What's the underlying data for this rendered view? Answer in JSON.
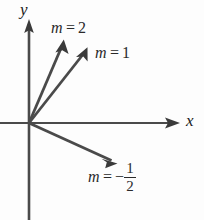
{
  "figure": {
    "type": "coordinate-diagram",
    "background_color": "#fdfdfd",
    "stroke_color": "#3a3a3a",
    "text_color": "#2a2a2a",
    "width": 204,
    "height": 220
  },
  "axes": {
    "origin": {
      "x": 29,
      "y": 123
    },
    "x_axis": {
      "label": "x",
      "start": {
        "x": 0,
        "y": 123
      },
      "end": {
        "x": 179,
        "y": 123
      },
      "arrow": "right",
      "label_pos": {
        "x": 186,
        "y": 112
      }
    },
    "y_axis": {
      "label": "y",
      "start": {
        "x": 29,
        "y": 220
      },
      "end": {
        "x": 29,
        "y": 22
      },
      "arrow": "up",
      "label_pos": {
        "x": 20,
        "y": 1
      }
    }
  },
  "rays": [
    {
      "name": "slope-2-ray",
      "slope": 2,
      "label_text": {
        "var": "m",
        "eq": "=",
        "value": "2"
      },
      "from": {
        "x": 29,
        "y": 123
      },
      "to": {
        "x": 63,
        "y": 41
      },
      "label_pos": {
        "x": 51,
        "y": 20
      }
    },
    {
      "name": "slope-1-ray",
      "slope": 1,
      "label_text": {
        "var": "m",
        "eq": "=",
        "value": "1"
      },
      "from": {
        "x": 29,
        "y": 123
      },
      "to": {
        "x": 87,
        "y": 49
      },
      "label_pos": {
        "x": 95,
        "y": 45
      }
    },
    {
      "name": "slope-negative-half-ray",
      "slope": -0.5,
      "label_text": {
        "var": "m",
        "eq": "=",
        "minus": "−",
        "numerator": "1",
        "denominator": "2"
      },
      "from": {
        "x": 29,
        "y": 123
      },
      "to": {
        "x": 116,
        "y": 163
      },
      "label_pos": {
        "x": 88,
        "y": 162
      }
    }
  ]
}
